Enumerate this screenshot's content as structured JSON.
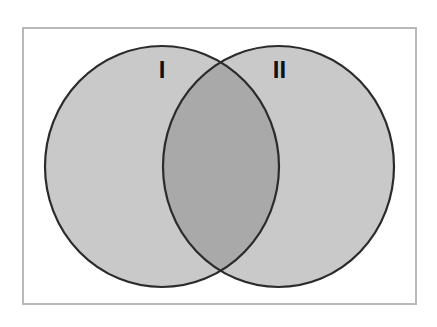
{
  "diagram": {
    "type": "venn",
    "frame": {
      "x": 23,
      "y": 28,
      "width": 393,
      "height": 276,
      "stroke": "#b9b9b9"
    },
    "sets": [
      {
        "id": "I",
        "label": "I",
        "cx": 162,
        "cy": 166.5,
        "rx": 117,
        "ry": 120.5,
        "fill": "#c9c9c9",
        "label_x": 162,
        "label_y": 78
      },
      {
        "id": "II",
        "label": "II",
        "cx": 278.5,
        "cy": 166.5,
        "rx": 115.5,
        "ry": 120.5,
        "fill": "#c9c9c9",
        "label_x": 279.5,
        "label_y": 78
      }
    ],
    "intersection": {
      "label": "",
      "fill": "#a9a9a9"
    },
    "outline_color": "#2b2b2b"
  }
}
